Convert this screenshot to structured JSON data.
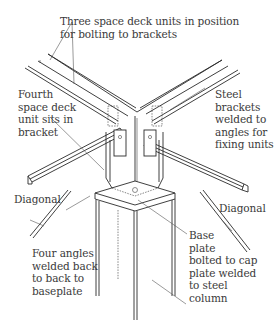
{
  "diagram": {
    "labels": {
      "three_units": "Three space deck units in position\nfor bolting to brackets",
      "fourth_unit": "Fourth\nspace deck\nunit sits in\nbracket",
      "steel_brackets": "Steel\nbrackets\nwelded to\nangles for\nfixing units",
      "diagonal_left": "Diagonal",
      "diagonal_right": "Diagonal",
      "four_angles": "Four angles\nwelded back\nto back to\nbaseplate",
      "base_plate": "Base\nplate\nbolted to cap\nplate welded\nto steel\ncolumn"
    },
    "components": [
      "space deck top chord angles",
      "steel brackets",
      "four welded angles",
      "diagonals",
      "base plate",
      "cap plate",
      "steel column"
    ],
    "line_color": "#2a2a2a",
    "text_color": "#3a3a3a"
  }
}
